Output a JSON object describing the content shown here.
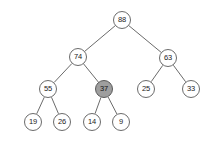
{
  "figure": {
    "type": "binary-tree-diagram",
    "background_color": "#ffffff",
    "node_fill": "#ffffff",
    "node_stroke": "#6b6b6b",
    "highlight_fill": "#9e9e9e",
    "edge_color": "#6b6b6b",
    "text_color": "#1a1a1a"
  },
  "nodes": [
    {
      "id": "n88",
      "label": "88",
      "x": 122,
      "y": 20,
      "highlighted": false
    },
    {
      "id": "n74",
      "label": "74",
      "x": 78,
      "y": 57,
      "highlighted": false
    },
    {
      "id": "n63",
      "label": "63",
      "x": 168,
      "y": 58,
      "highlighted": false
    },
    {
      "id": "n55",
      "label": "55",
      "x": 48,
      "y": 89,
      "highlighted": false
    },
    {
      "id": "n37",
      "label": "37",
      "x": 104,
      "y": 89,
      "highlighted": true
    },
    {
      "id": "n25",
      "label": "25",
      "x": 146,
      "y": 89,
      "highlighted": false
    },
    {
      "id": "n33",
      "label": "33",
      "x": 191,
      "y": 89,
      "highlighted": false
    },
    {
      "id": "n19",
      "label": "19",
      "x": 33,
      "y": 122,
      "highlighted": false
    },
    {
      "id": "n26",
      "label": "26",
      "x": 62,
      "y": 122,
      "highlighted": false
    },
    {
      "id": "n14",
      "label": "14",
      "x": 92,
      "y": 122,
      "highlighted": false
    },
    {
      "id": "n9",
      "label": "9",
      "x": 121,
      "y": 122,
      "highlighted": false
    }
  ],
  "edges": [
    {
      "from": "n88",
      "to": "n74"
    },
    {
      "from": "n88",
      "to": "n63"
    },
    {
      "from": "n74",
      "to": "n55"
    },
    {
      "from": "n74",
      "to": "n37"
    },
    {
      "from": "n63",
      "to": "n25"
    },
    {
      "from": "n63",
      "to": "n33"
    },
    {
      "from": "n55",
      "to": "n19"
    },
    {
      "from": "n55",
      "to": "n26"
    },
    {
      "from": "n37",
      "to": "n14"
    },
    {
      "from": "n37",
      "to": "n9"
    }
  ]
}
